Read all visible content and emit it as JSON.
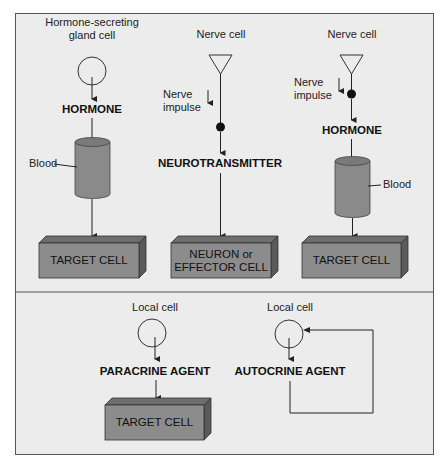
{
  "diagram": {
    "top_panel": {
      "endocrine": {
        "source_label": "Hormone-secreting\ngland cell",
        "agent_label": "HORMONE",
        "medium_label": "Blood",
        "target_label": "TARGET CELL"
      },
      "neural": {
        "source_label": "Nerve cell",
        "impulse_label": "Nerve\nimpulse",
        "agent_label": "NEUROTRANSMITTER",
        "target_label": "NEURON or\nEFFECTOR CELL"
      },
      "neuroendocrine": {
        "source_label": "Nerve cell",
        "impulse_label": "Nerve\nimpulse",
        "agent_label": "HORMONE",
        "medium_label": "Blood",
        "target_label": "TARGET CELL"
      }
    },
    "bottom_panel": {
      "paracrine": {
        "source_label": "Local cell",
        "agent_label": "PARACRINE AGENT",
        "target_label": "TARGET CELL"
      },
      "autocrine": {
        "source_label": "Local cell",
        "agent_label": "AUTOCRINE AGENT"
      }
    },
    "colors": {
      "background": "#ececec",
      "box_front": "#8c8c8c",
      "box_top": "#6e6e6e",
      "box_side": "#5a5a5a",
      "cylinder": "#8a8a8a",
      "line": "#222222"
    }
  }
}
